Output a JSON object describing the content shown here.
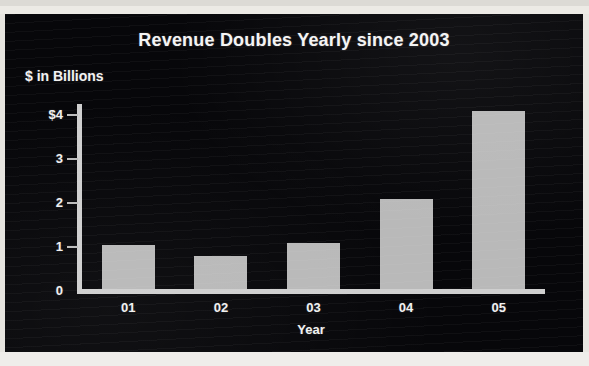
{
  "chart_data": {
    "type": "bar",
    "title": "Revenue Doubles Yearly since 2003",
    "xlabel": "Year",
    "ylabel": "$ in Billions",
    "categories": [
      "01",
      "02",
      "03",
      "04",
      "05"
    ],
    "values": [
      1.0,
      0.75,
      1.05,
      2.05,
      4.05
    ],
    "ytick_labels": [
      "$4",
      "3",
      "2",
      "1",
      "0"
    ],
    "ytick_values": [
      4,
      3,
      2,
      1,
      0
    ],
    "ylim": [
      0,
      4.3
    ],
    "grid": false,
    "legend": null,
    "bar_color": "#b9b9b9",
    "background_color": "#07070a",
    "text_color": "#f2f2f2",
    "axis_color": "#cfcfcf"
  }
}
